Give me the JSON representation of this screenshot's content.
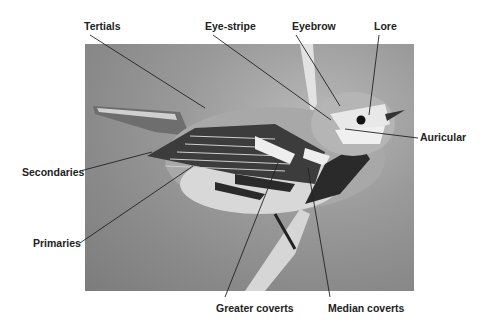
{
  "diagram": {
    "labels": [
      {
        "id": "tertials",
        "text": "Tertials",
        "x": 84,
        "y": 20
      },
      {
        "id": "eye-stripe",
        "text": "Eye-stripe",
        "x": 205,
        "y": 20
      },
      {
        "id": "eyebrow",
        "text": "Eyebrow",
        "x": 292,
        "y": 20
      },
      {
        "id": "lore",
        "text": "Lore",
        "x": 374,
        "y": 20
      },
      {
        "id": "auricular",
        "text": "Auricular",
        "x": 420,
        "y": 131
      },
      {
        "id": "secondaries",
        "text": "Secondaries",
        "x": 22,
        "y": 166
      },
      {
        "id": "primaries",
        "text": "Primaries",
        "x": 33,
        "y": 237
      },
      {
        "id": "greater-coverts",
        "text": "Greater coverts",
        "x": 216,
        "y": 302
      },
      {
        "id": "median-coverts",
        "text": "Median coverts",
        "x": 328,
        "y": 302
      }
    ],
    "leader_lines": [
      {
        "id": "tertials",
        "x1": 90,
        "y1": 35,
        "x2": 205,
        "y2": 108
      },
      {
        "id": "eye-stripe",
        "x1": 213,
        "y1": 35,
        "x2": 331,
        "y2": 120
      },
      {
        "id": "eyebrow",
        "x1": 296,
        "y1": 35,
        "x2": 340,
        "y2": 106
      },
      {
        "id": "lore",
        "x1": 379,
        "y1": 35,
        "x2": 369,
        "y2": 115
      },
      {
        "id": "auricular",
        "x1": 418,
        "y1": 138,
        "x2": 345,
        "y2": 129
      },
      {
        "id": "secondaries",
        "x1": 80,
        "y1": 171,
        "x2": 152,
        "y2": 152
      },
      {
        "id": "primaries",
        "x1": 80,
        "y1": 243,
        "x2": 193,
        "y2": 166
      },
      {
        "id": "greater-coverts",
        "x1": 225,
        "y1": 297,
        "x2": 278,
        "y2": 163
      },
      {
        "id": "median-coverts",
        "x1": 330,
        "y1": 297,
        "x2": 308,
        "y2": 168
      }
    ]
  }
}
